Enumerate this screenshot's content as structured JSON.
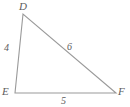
{
  "figure": {
    "type": "triangle",
    "name": "triangle-DEF",
    "background_color": "#ffffff",
    "stroke_color": "#9a9a9a",
    "label_color": "#5c5c5c",
    "vertices": [
      {
        "id": "D",
        "label": "D",
        "x": 23,
        "y": 14
      },
      {
        "id": "E",
        "label": "E",
        "x": 15,
        "y": 93
      },
      {
        "id": "F",
        "label": "F",
        "x": 116,
        "y": 93
      }
    ],
    "sides": [
      {
        "id": "DE",
        "label": "4",
        "from": "D",
        "to": "E"
      },
      {
        "id": "DF",
        "label": "6",
        "from": "D",
        "to": "F"
      },
      {
        "id": "EF",
        "label": "5",
        "from": "E",
        "to": "F"
      }
    ],
    "labels": {
      "vertex_d": "D",
      "vertex_e": "E",
      "vertex_f": "F",
      "side_de": "4",
      "side_df": "6",
      "side_ef": "5"
    }
  }
}
